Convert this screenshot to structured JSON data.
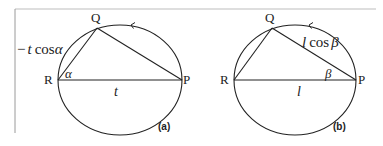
{
  "figure": {
    "frame_color": "#9a9a9a",
    "stroke_color": "#222222",
    "panels": [
      {
        "id": "a",
        "caption": "(a)",
        "points": {
          "Q": "Q",
          "R": "R",
          "P": "P"
        },
        "angle_label": "α",
        "base_label": "t",
        "side_label_prefix": "−",
        "side_label_var": "t",
        "side_label_fn": "cos",
        "side_label_angle": "α"
      },
      {
        "id": "b",
        "caption": "(b)",
        "points": {
          "Q": "Q",
          "R": "R",
          "P": "P"
        },
        "angle_label": "β",
        "base_label": "l",
        "side_label_var": "l",
        "side_label_fn": "cos",
        "side_label_angle": "β"
      }
    ]
  }
}
